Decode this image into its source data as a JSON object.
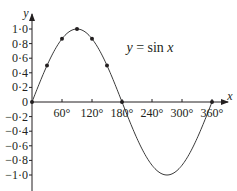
{
  "chart_data": {
    "type": "line",
    "title": "",
    "xlabel": "x",
    "ylabel": "y",
    "annotation": "y = sin x",
    "x_ticks": [
      "60°",
      "120°",
      "180°",
      "240°",
      "300°",
      "360°"
    ],
    "x_tick_values": [
      60,
      120,
      180,
      240,
      300,
      360
    ],
    "y_ticks": [
      "1·0",
      "0·8",
      "0·6",
      "0·4",
      "0·2",
      "0",
      "−0·2",
      "−0·4",
      "−0·6",
      "−0·8",
      "−1·0"
    ],
    "y_tick_values": [
      1.0,
      0.8,
      0.6,
      0.4,
      0.2,
      0,
      -0.2,
      -0.4,
      -0.6,
      -0.8,
      -1.0
    ],
    "xlim": [
      0,
      360
    ],
    "ylim": [
      -1.0,
      1.0
    ],
    "grid": false,
    "series": [
      {
        "name": "y = sin x",
        "function": "sin",
        "x_range": [
          0,
          360
        ]
      }
    ],
    "marked_points": [
      {
        "x": 0,
        "y": 0
      },
      {
        "x": 30,
        "y": 0.5
      },
      {
        "x": 60,
        "y": 0.866
      },
      {
        "x": 90,
        "y": 1.0
      },
      {
        "x": 120,
        "y": 0.866
      },
      {
        "x": 150,
        "y": 0.5
      },
      {
        "x": 180,
        "y": 0
      },
      {
        "x": 360,
        "y": 0
      }
    ]
  }
}
